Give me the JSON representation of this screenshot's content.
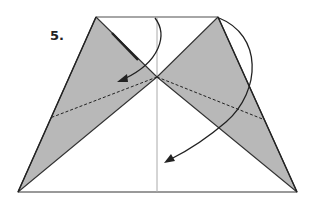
{
  "diagram": {
    "type": "origami-instruction",
    "step_label": "5.",
    "colors": {
      "paper_back": "#ffffff",
      "paper_colored": "#b8b8b8",
      "outline": "#222222",
      "center_line": "#999999",
      "arrow": "#222222"
    },
    "shape": {
      "outline": "trapezoid",
      "top_left": [
        96,
        17
      ],
      "top_right": [
        218,
        17
      ],
      "bottom_right": [
        297,
        192
      ],
      "bottom_left": [
        18,
        192
      ],
      "center_point": [
        157,
        77
      ]
    },
    "fold_lines": [
      {
        "type": "valley-dashed",
        "from": [
          157,
          77
        ],
        "to": [
          50,
          118
        ]
      },
      {
        "type": "valley-dashed",
        "from": [
          157,
          77
        ],
        "to": [
          265,
          120
        ]
      }
    ],
    "arrows": [
      {
        "name": "fold-left-flap-down",
        "from": [
          155,
          18
        ],
        "to": [
          118,
          82
        ]
      },
      {
        "name": "fold-right-flap-down",
        "from": [
          218,
          18
        ],
        "to": [
          165,
          163
        ]
      }
    ]
  }
}
